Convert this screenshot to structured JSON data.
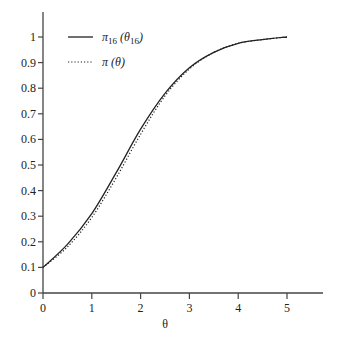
{
  "chart_data": {
    "type": "line",
    "title": "",
    "xlabel": "θ",
    "ylabel": "",
    "xlim": [
      0,
      5.7
    ],
    "ylim": [
      0,
      1.1
    ],
    "xticks": [
      "0",
      "1",
      "2",
      "3",
      "4",
      "5"
    ],
    "yticks": [
      "0",
      "0.1",
      "0.2",
      "0.3",
      "0.4",
      "0.5",
      "0.6",
      "0.7",
      "0.8",
      "0.9",
      "1"
    ],
    "grid": false,
    "legend_position": "upper-left",
    "x": [
      0,
      0.5,
      1,
      1.5,
      2,
      2.5,
      3,
      3.5,
      4,
      4.5,
      5
    ],
    "series": [
      {
        "name": "π16 (θ16)",
        "style": "solid",
        "values": [
          0.1,
          0.19,
          0.31,
          0.47,
          0.64,
          0.78,
          0.88,
          0.94,
          0.975,
          0.99,
          1.0
        ]
      },
      {
        "name": "π (θ)",
        "style": "dotted",
        "values": [
          0.1,
          0.18,
          0.295,
          0.45,
          0.62,
          0.77,
          0.875,
          0.94,
          0.975,
          0.99,
          1.0
        ]
      }
    ]
  },
  "legend": {
    "solid_main": "π",
    "solid_sub": "16",
    "solid_arg": "(θ",
    "solid_arg_sub": "16",
    "solid_close": ")",
    "dotted_label": "π (θ)"
  },
  "axis": {
    "xlabel": "θ"
  },
  "colors": {
    "line": "#222222",
    "axis": "#444444"
  }
}
